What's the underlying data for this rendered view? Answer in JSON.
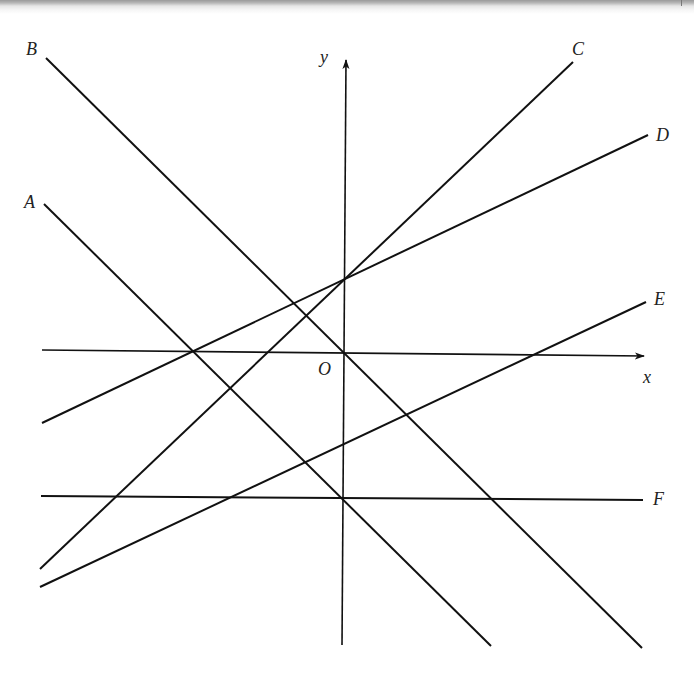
{
  "diagram": {
    "title": "",
    "colors": {
      "line": "#111111",
      "label": "#222222",
      "background": "#ffffff",
      "frame": "#9a9a9a"
    },
    "axes": {
      "origin_label": "O",
      "x_label": "x",
      "y_label": "y"
    },
    "lines": [
      {
        "id": "A",
        "label": "A",
        "description": "line with negative slope, passes through x-axis left of origin and through y-intercept shared with F"
      },
      {
        "id": "B",
        "label": "B",
        "description": "line with negative slope passing through origin"
      },
      {
        "id": "C",
        "label": "C",
        "description": "line with positive slope, positive y-intercept shared with D"
      },
      {
        "id": "D",
        "label": "D",
        "description": "line with gentler positive slope, positive y-intercept shared with C"
      },
      {
        "id": "E",
        "label": "E",
        "description": "line with gentle positive slope, negative y-intercept"
      },
      {
        "id": "F",
        "label": "F",
        "description": "horizontal line below x-axis"
      }
    ]
  }
}
